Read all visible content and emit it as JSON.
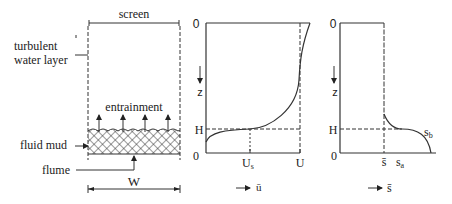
{
  "left_panel": {
    "screen_label": "screen",
    "turbulent_label_line1": "turbulent",
    "turbulent_label_line2": "water layer",
    "entrainment_label": "entrainment",
    "fluid_mud_label": "fluid mud",
    "flume_label": "flume",
    "width_label": "W"
  },
  "velocity_panel": {
    "origin_top": "0",
    "origin_bottom": "0",
    "z_label": "z",
    "h_label": "H",
    "us_label": "U",
    "us_sub": "s",
    "u_label": "U",
    "axis_label": "ū"
  },
  "concentration_panel": {
    "origin_top": "0",
    "origin_bottom": "0",
    "z_label": "z",
    "h_label": "H",
    "sbar_label": "s̄",
    "sa_label": "s",
    "sa_sub": "a",
    "sb_label": "s",
    "sb_sub": "b",
    "axis_label": "s̄"
  }
}
